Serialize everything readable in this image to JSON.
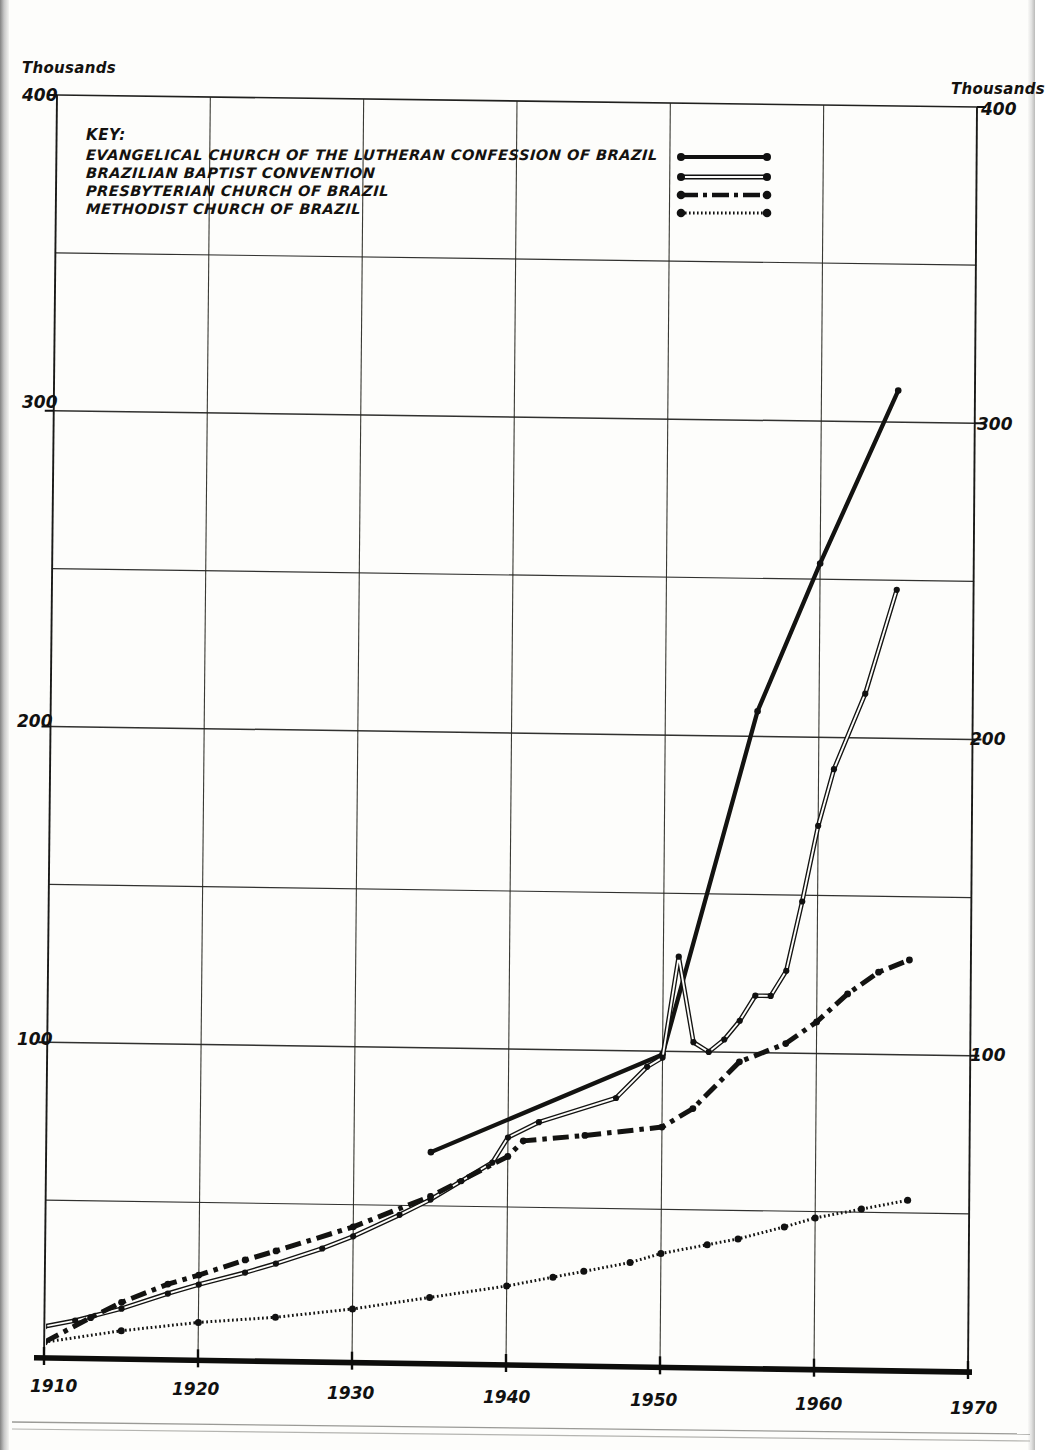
{
  "axis_labels": {
    "left_unit": "Thousands",
    "right_unit": "Thousands",
    "left_ticks": [
      "400",
      "300",
      "200",
      "100"
    ],
    "right_ticks": [
      "400",
      "300",
      "200",
      "100"
    ],
    "x_ticks": [
      "1910",
      "1920",
      "1930",
      "1940",
      "1950",
      "1960",
      "1970"
    ]
  },
  "legend": {
    "title": "KEY:",
    "entries": [
      {
        "label": "EVANGELICAL CHURCH OF THE LUTHERAN CONFESSION OF BRAZIL",
        "style": "thick-solid",
        "sample_name": "legend-sample-lutheran"
      },
      {
        "label": "BRAZILIAN BAPTIST CONVENTION",
        "style": "thin-double",
        "sample_name": "legend-sample-baptist"
      },
      {
        "label": "PRESBYTERIAN CHURCH OF BRAZIL",
        "style": "dash-dot",
        "sample_name": "legend-sample-presbyterian"
      },
      {
        "label": "METHODIST CHURCH OF BRAZIL",
        "style": "dotted",
        "sample_name": "legend-sample-methodist"
      }
    ]
  },
  "chart_data": {
    "type": "line",
    "title": "",
    "xlabel": "",
    "ylabel": "Thousands",
    "xlim": [
      1910,
      1970
    ],
    "ylim": [
      0,
      400
    ],
    "ytick_step": 50,
    "ytick_labeled_step": 100,
    "grid": true,
    "legend_position": "top-left-inside",
    "ink_color": "#111111",
    "series": [
      {
        "name": "EVANGELICAL CHURCH OF THE LUTHERAN CONFESSION OF BRAZIL",
        "style": "thick-solid",
        "points": [
          [
            1935,
            67
          ],
          [
            1950,
            99
          ],
          [
            1956,
            208
          ],
          [
            1960,
            255
          ],
          [
            1965,
            310
          ]
        ]
      },
      {
        "name": "BRAZILIAN BAPTIST CONVENTION",
        "style": "thin-double",
        "points": [
          [
            1910,
            10
          ],
          [
            1912,
            12
          ],
          [
            1915,
            16
          ],
          [
            1918,
            21
          ],
          [
            1920,
            24
          ],
          [
            1923,
            28
          ],
          [
            1925,
            31
          ],
          [
            1928,
            36
          ],
          [
            1930,
            40
          ],
          [
            1933,
            47
          ],
          [
            1935,
            52
          ],
          [
            1937,
            58
          ],
          [
            1939,
            64
          ],
          [
            1940,
            72
          ],
          [
            1942,
            77
          ],
          [
            1947,
            85
          ],
          [
            1949,
            95
          ],
          [
            1950,
            98
          ],
          [
            1951,
            130
          ],
          [
            1952,
            103
          ],
          [
            1953,
            100
          ],
          [
            1954,
            104
          ],
          [
            1955,
            110
          ],
          [
            1956,
            118
          ],
          [
            1957,
            118
          ],
          [
            1958,
            126
          ],
          [
            1959,
            148
          ],
          [
            1960,
            172
          ],
          [
            1961,
            190
          ],
          [
            1963,
            214
          ],
          [
            1965,
            247
          ]
        ]
      },
      {
        "name": "PRESBYTERIAN CHURCH OF BRAZIL",
        "style": "dash-dot",
        "points": [
          [
            1910,
            5
          ],
          [
            1913,
            13
          ],
          [
            1915,
            18
          ],
          [
            1918,
            24
          ],
          [
            1920,
            27
          ],
          [
            1923,
            32
          ],
          [
            1925,
            35
          ],
          [
            1930,
            43
          ],
          [
            1935,
            53
          ],
          [
            1940,
            66
          ],
          [
            1941,
            71
          ],
          [
            1945,
            73
          ],
          [
            1950,
            76
          ],
          [
            1952,
            82
          ],
          [
            1955,
            97
          ],
          [
            1958,
            103
          ],
          [
            1960,
            110
          ],
          [
            1962,
            119
          ],
          [
            1964,
            126
          ],
          [
            1966,
            130
          ]
        ]
      },
      {
        "name": "METHODIST CHURCH OF BRAZIL",
        "style": "dotted",
        "points": [
          [
            1910,
            5
          ],
          [
            1915,
            9
          ],
          [
            1920,
            12
          ],
          [
            1925,
            14
          ],
          [
            1930,
            17
          ],
          [
            1935,
            21
          ],
          [
            1940,
            25
          ],
          [
            1943,
            28
          ],
          [
            1945,
            30
          ],
          [
            1948,
            33
          ],
          [
            1950,
            36
          ],
          [
            1953,
            39
          ],
          [
            1955,
            41
          ],
          [
            1958,
            45
          ],
          [
            1960,
            48
          ],
          [
            1963,
            51
          ],
          [
            1966,
            54
          ]
        ]
      }
    ]
  }
}
